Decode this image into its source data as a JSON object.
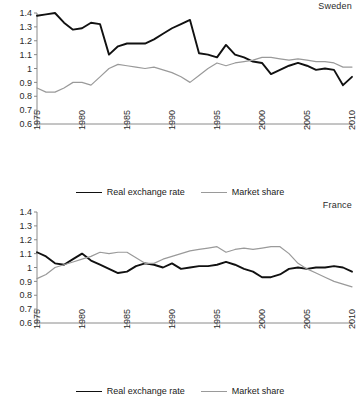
{
  "chart_data": [
    {
      "type": "line",
      "title": "Sweden",
      "xlabel": "",
      "ylabel": "",
      "xlim": [
        1975,
        2010
      ],
      "ylim": [
        0.6,
        1.4
      ],
      "grid": false,
      "legend_position": "bottom",
      "yticks": [
        "1.4",
        "1.3",
        "1.2",
        "1.1",
        "1",
        "0.9",
        "0.8",
        "0.7",
        "0.6"
      ],
      "ytick_values": [
        1.4,
        1.3,
        1.2,
        1.1,
        1.0,
        0.9,
        0.8,
        0.7,
        0.6
      ],
      "xticks": [
        "1975",
        "1980",
        "1985",
        "1990",
        "1995",
        "2000",
        "2005",
        "2010"
      ],
      "xtick_values": [
        1975,
        1980,
        1985,
        1990,
        1995,
        2000,
        2005,
        2010
      ],
      "x": [
        1975,
        1976,
        1977,
        1978,
        1979,
        1980,
        1981,
        1982,
        1983,
        1984,
        1985,
        1986,
        1987,
        1988,
        1989,
        1990,
        1991,
        1992,
        1993,
        1994,
        1995,
        1996,
        1997,
        1998,
        1999,
        2000,
        2001,
        2002,
        2003,
        2004,
        2005,
        2006,
        2007,
        2008,
        2009,
        2010
      ],
      "series": [
        {
          "name": "Real exchange rate",
          "color": "#111111",
          "width": 1.9,
          "values": [
            1.38,
            1.39,
            1.4,
            1.33,
            1.28,
            1.29,
            1.33,
            1.32,
            1.1,
            1.16,
            1.18,
            1.18,
            1.18,
            1.21,
            1.25,
            1.29,
            1.32,
            1.35,
            1.11,
            1.1,
            1.08,
            1.17,
            1.1,
            1.08,
            1.05,
            1.04,
            0.96,
            0.99,
            1.02,
            1.04,
            1.02,
            0.99,
            1.0,
            0.99,
            0.88,
            0.94
          ]
        },
        {
          "name": "Market share",
          "color": "#9a9a9a",
          "width": 1.2,
          "values": [
            0.86,
            0.83,
            0.83,
            0.86,
            0.9,
            0.9,
            0.88,
            0.94,
            1.0,
            1.03,
            1.02,
            1.01,
            1.0,
            1.01,
            0.99,
            0.97,
            0.94,
            0.9,
            0.95,
            1.0,
            1.04,
            1.02,
            1.04,
            1.05,
            1.06,
            1.08,
            1.08,
            1.07,
            1.06,
            1.07,
            1.06,
            1.05,
            1.05,
            1.04,
            1.01,
            1.01
          ]
        }
      ]
    },
    {
      "type": "line",
      "title": "France",
      "xlabel": "",
      "ylabel": "",
      "xlim": [
        1975,
        2010
      ],
      "ylim": [
        0.6,
        1.4
      ],
      "grid": false,
      "legend_position": "bottom",
      "yticks": [
        "1.4",
        "1.3",
        "1.2",
        "1.1",
        "1",
        "0.9",
        "0.8",
        "0.7",
        "0.6"
      ],
      "ytick_values": [
        1.4,
        1.3,
        1.2,
        1.1,
        1.0,
        0.9,
        0.8,
        0.7,
        0.6
      ],
      "xticks": [
        "1975",
        "1980",
        "1985",
        "1990",
        "1995",
        "2000",
        "2005",
        "2010"
      ],
      "xtick_values": [
        1975,
        1980,
        1985,
        1990,
        1995,
        2000,
        2005,
        2010
      ],
      "x": [
        1975,
        1976,
        1977,
        1978,
        1979,
        1980,
        1981,
        1982,
        1983,
        1984,
        1985,
        1986,
        1987,
        1988,
        1989,
        1990,
        1991,
        1992,
        1993,
        1994,
        1995,
        1996,
        1997,
        1998,
        1999,
        2000,
        2001,
        2002,
        2003,
        2004,
        2005,
        2006,
        2007,
        2008,
        2009,
        2010
      ],
      "series": [
        {
          "name": "Real exchange rate",
          "color": "#111111",
          "width": 1.9,
          "values": [
            1.11,
            1.08,
            1.03,
            1.02,
            1.06,
            1.1,
            1.05,
            1.02,
            0.99,
            0.96,
            0.97,
            1.01,
            1.03,
            1.02,
            1.0,
            1.03,
            0.99,
            1.0,
            1.01,
            1.01,
            1.02,
            1.04,
            1.02,
            0.99,
            0.97,
            0.93,
            0.93,
            0.95,
            0.99,
            1.0,
            0.99,
            1.0,
            1.0,
            1.01,
            1.0,
            0.97
          ]
        },
        {
          "name": "Market share",
          "color": "#9a9a9a",
          "width": 1.2,
          "values": [
            0.92,
            0.95,
            1.0,
            1.02,
            1.04,
            1.06,
            1.08,
            1.11,
            1.1,
            1.11,
            1.11,
            1.07,
            1.03,
            1.03,
            1.06,
            1.08,
            1.1,
            1.12,
            1.13,
            1.14,
            1.15,
            1.11,
            1.13,
            1.14,
            1.13,
            1.14,
            1.15,
            1.15,
            1.1,
            1.03,
            0.99,
            0.96,
            0.93,
            0.9,
            0.88,
            0.86
          ]
        }
      ]
    }
  ],
  "panels": [
    {
      "title": "Sweden",
      "legend": [
        {
          "label": "Real exchange rate",
          "swatch": "line-swatch-black"
        },
        {
          "label": "Market share",
          "swatch": "line-swatch-gray"
        }
      ]
    },
    {
      "title": "France",
      "legend": [
        {
          "label": "Real exchange rate",
          "swatch": "line-swatch-black"
        },
        {
          "label": "Market share",
          "swatch": "line-swatch-gray"
        }
      ]
    }
  ]
}
